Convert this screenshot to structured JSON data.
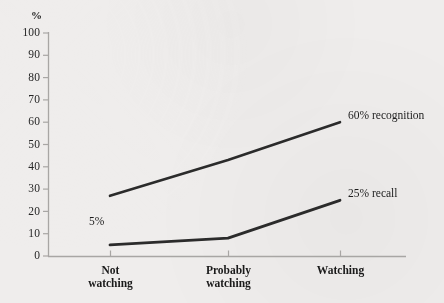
{
  "chart_data": {
    "type": "line",
    "title": "",
    "xlabel": "",
    "ylabel": "%",
    "ylim": [
      0,
      100
    ],
    "ytick_step": 10,
    "grid": false,
    "legend_position": "inline-right-of-line-end",
    "categories": [
      "Not watching",
      "Probably watching",
      "Watching"
    ],
    "category_lines": [
      [
        "Not",
        "watching"
      ],
      [
        "Probably",
        "watching"
      ],
      [
        "Watching"
      ]
    ],
    "ytick_labels": [
      "100",
      "90",
      "80",
      "70",
      "60",
      "50",
      "40",
      "30",
      "20",
      "10",
      "0"
    ],
    "ytick_values": [
      100,
      90,
      80,
      70,
      60,
      50,
      40,
      30,
      20,
      10,
      0
    ],
    "series": [
      {
        "name": "recognition",
        "end_label": "60% recognition",
        "values": [
          27,
          43,
          60
        ],
        "color": "#2b2b2b"
      },
      {
        "name": "recall",
        "end_label": "25% recall",
        "values": [
          5,
          8,
          25
        ],
        "color": "#2b2b2b"
      }
    ],
    "annotations": [
      {
        "text": "5%",
        "series": "recall",
        "category": "Not watching",
        "value": 5
      },
      {
        "text": "60% recognition",
        "series": "recognition",
        "category": "Watching",
        "value": 60
      },
      {
        "text": "25% recall",
        "series": "recall",
        "category": "Watching",
        "value": 25
      }
    ],
    "axis_color": "#a8a6a4",
    "background_color": "#efedec"
  },
  "axis": {
    "y_unit_symbol": "%"
  }
}
